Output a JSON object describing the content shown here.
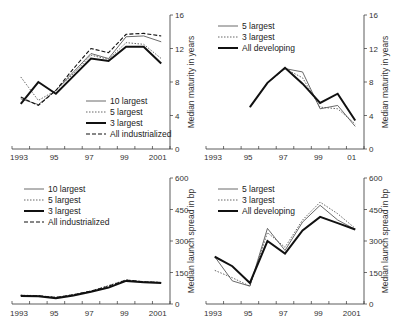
{
  "chart_data": [
    {
      "type": "line",
      "panel": "top-left",
      "title": "",
      "xlabel": "",
      "ylabel": "Median maturity in years",
      "ylim": [
        0,
        16
      ],
      "yticks": [
        0,
        4,
        8,
        12,
        16
      ],
      "xticks": [
        "1993",
        "95",
        "97",
        "99",
        "2001"
      ],
      "x": [
        1993.5,
        1994.5,
        1995.5,
        1996.5,
        1997.5,
        1998.5,
        1999.5,
        2000.5,
        2001.5
      ],
      "legend_position": "lower right",
      "series": [
        {
          "name": "10 largest",
          "style": "thin-solid",
          "values": [
            6.0,
            5.3,
            7.0,
            9.2,
            11.4,
            10.8,
            13.4,
            13.5,
            12.8
          ]
        },
        {
          "name": "5 largest",
          "style": "dotted",
          "values": [
            8.6,
            5.8,
            7.0,
            9.0,
            11.2,
            10.7,
            12.7,
            12.5,
            10.8
          ]
        },
        {
          "name": "3 largest",
          "style": "thick-solid",
          "values": [
            5.4,
            8.0,
            6.6,
            8.7,
            10.8,
            10.5,
            12.2,
            12.2,
            10.2
          ]
        },
        {
          "name": "All industrialized",
          "style": "dashed",
          "values": [
            6.2,
            5.2,
            7.0,
            9.6,
            12.0,
            11.5,
            13.7,
            13.8,
            13.5
          ]
        }
      ]
    },
    {
      "type": "line",
      "panel": "top-right",
      "title": "",
      "xlabel": "",
      "ylabel": "Median maturity in years",
      "ylim": [
        0,
        16
      ],
      "yticks": [
        0,
        4,
        8,
        12,
        16
      ],
      "xticks": [
        "1993",
        "95",
        "97",
        "99",
        "01"
      ],
      "x": [
        1995.5,
        1996.5,
        1997.5,
        1998.5,
        1999.5,
        2000.5,
        2001.5
      ],
      "legend_position": "upper left",
      "series": [
        {
          "name": "5 largest",
          "style": "thin-solid",
          "values": [
            5.0,
            7.9,
            9.6,
            9.2,
            4.8,
            5.2,
            2.7
          ]
        },
        {
          "name": "3 largest",
          "style": "dotted",
          "values": [
            5.0,
            7.9,
            9.6,
            8.5,
            5.0,
            4.8,
            3.0
          ]
        },
        {
          "name": "All developing",
          "style": "thick-solid",
          "values": [
            5.0,
            7.9,
            9.7,
            7.8,
            5.5,
            6.6,
            3.4
          ]
        }
      ]
    },
    {
      "type": "line",
      "panel": "bottom-left",
      "title": "",
      "xlabel": "",
      "ylabel": "Median launch spread in bp",
      "ylim": [
        0,
        600
      ],
      "yticks": [
        0,
        150,
        300,
        450,
        600
      ],
      "xticks": [
        "1993",
        "95",
        "97",
        "99",
        "2001"
      ],
      "x": [
        1993.5,
        1994.5,
        1995.5,
        1996.5,
        1997.5,
        1998.5,
        1999.5,
        2000.5,
        2001.5
      ],
      "legend_position": "upper left",
      "series": [
        {
          "name": "10 largest",
          "style": "thin-solid",
          "values": [
            40,
            38,
            30,
            42,
            60,
            80,
            112,
            105,
            102
          ]
        },
        {
          "name": "5 largest",
          "style": "dotted",
          "values": [
            42,
            40,
            32,
            45,
            62,
            88,
            115,
            106,
            103
          ]
        },
        {
          "name": "3 largest",
          "style": "thick-solid",
          "values": [
            38,
            37,
            28,
            40,
            58,
            78,
            110,
            104,
            100
          ]
        },
        {
          "name": "All industrialized",
          "style": "dashed",
          "values": [
            41,
            39,
            31,
            44,
            61,
            85,
            114,
            106,
            102
          ]
        }
      ]
    },
    {
      "type": "line",
      "panel": "bottom-right",
      "title": "",
      "xlabel": "",
      "ylabel": "Median launch spread in bp",
      "ylim": [
        0,
        600
      ],
      "yticks": [
        0,
        150,
        300,
        450,
        600
      ],
      "xticks": [
        "1993",
        "95",
        "97",
        "99",
        "2001"
      ],
      "x": [
        1993.5,
        1994.5,
        1995.5,
        1996.5,
        1997.5,
        1998.5,
        1999.5,
        2000.5,
        2001.5
      ],
      "legend_position": "upper left",
      "series": [
        {
          "name": "5 largest",
          "style": "thin-solid",
          "values": [
            225,
            110,
            85,
            360,
            255,
            390,
            470,
            400,
            355
          ]
        },
        {
          "name": "3 largest",
          "style": "dotted",
          "values": [
            160,
            125,
            85,
            340,
            270,
            400,
            485,
            430,
            360
          ]
        },
        {
          "name": "All developing",
          "style": "thick-solid",
          "values": [
            225,
            180,
            100,
            300,
            240,
            350,
            415,
            385,
            355
          ]
        }
      ]
    }
  ]
}
